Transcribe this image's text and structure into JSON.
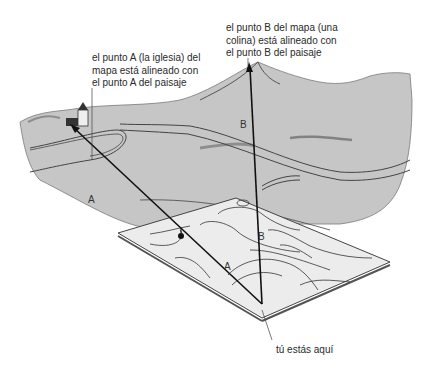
{
  "diagram": {
    "type": "map-orientation-illustration",
    "annotations": {
      "point_b": "el punto B del mapa (una\ncolina) está alineado con\nel punto B del paisaje",
      "point_a": "el punto A (la iglesia) del\nmapa está alineado con\nel punto A del paisaje",
      "you_are_here": "tú estás aquí"
    },
    "labels": {
      "landscape_a": "A",
      "landscape_b": "B",
      "map_a": "A",
      "map_b": "B"
    },
    "colors": {
      "landscape": "#c8c8c8",
      "map_sheet": "#ebebeb",
      "lines": "#333333",
      "sight_lines": "#111111"
    }
  }
}
